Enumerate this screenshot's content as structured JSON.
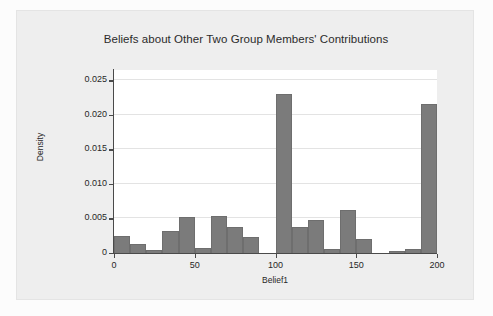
{
  "figure": {
    "background_color": "#fcfcfc",
    "panel_color": "#eeeeee",
    "plot_background": "#ffffff",
    "bar_color": "#7b7b7b",
    "axis_color": "#4a4a4a",
    "grid_color": "#e3e3e3"
  },
  "chart_data": {
    "type": "bar",
    "title": "Beliefs about Other Two Group Members' Contributions",
    "xlabel": "Belief1",
    "ylabel": "Density",
    "xlim": [
      0,
      200
    ],
    "ylim": [
      0,
      0.0265
    ],
    "grid": true,
    "legend": null,
    "bin_width": 10,
    "xticks": [
      0,
      50,
      100,
      150,
      200
    ],
    "xtick_labels": [
      "0",
      "50",
      "100",
      "150",
      "200"
    ],
    "yticks": [
      0,
      0.005,
      0.01,
      0.015,
      0.02,
      0.025
    ],
    "ytick_labels": [
      "0",
      "0.005",
      "0.010",
      "0.015",
      "0.020",
      "0.025"
    ],
    "categories": [
      "0-10",
      "10-20",
      "20-30",
      "30-40",
      "40-50",
      "50-60",
      "60-70",
      "70-80",
      "80-90",
      "90-100",
      "100-110",
      "110-120",
      "120-130",
      "130-140",
      "140-150",
      "150-160",
      "160-170",
      "170-180",
      "180-190",
      "190-200"
    ],
    "bin_starts": [
      0,
      10,
      20,
      30,
      40,
      50,
      60,
      70,
      80,
      90,
      100,
      110,
      120,
      130,
      140,
      150,
      160,
      170,
      180,
      190
    ],
    "values": [
      0.00245,
      0.00135,
      0.00045,
      0.00315,
      0.00515,
      0.0007,
      0.0054,
      0.0037,
      0.00235,
      0.0,
      0.023,
      0.0037,
      0.00485,
      0.00065,
      0.0062,
      0.0021,
      0.0,
      0.00035,
      0.00065,
      0.02155
    ]
  }
}
